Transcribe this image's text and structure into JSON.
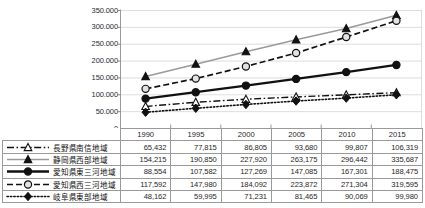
{
  "chart_data": {
    "type": "line",
    "title": "",
    "xlabel": "",
    "ylabel": "",
    "categories": [
      "1990",
      "1995",
      "2000",
      "2005",
      "2010",
      "2015"
    ],
    "ylim": [
      0,
      350000
    ],
    "ytick_values": [
      0,
      50000,
      100000,
      150000,
      200000,
      250000,
      300000,
      350000
    ],
    "ytick_labels": [
      "0",
      "50.000",
      "100.000",
      "150.000",
      "200.000",
      "250.000",
      "300.000",
      "350.000"
    ],
    "grid": true,
    "legend_position": "table-left",
    "series": [
      {
        "name": "長野県南信地域",
        "values": [
          65432,
          77815,
          86805,
          93680,
          99807,
          106319
        ],
        "value_labels": [
          "65,432",
          "77,815",
          "86,805",
          "93,680",
          "99,807",
          "106,319"
        ],
        "marker": "triangle-open",
        "line_style": "dashdot",
        "color": "#111111"
      },
      {
        "name": "静岡県西部地域",
        "values": [
          154215,
          190850,
          227920,
          263175,
          296442,
          335687
        ],
        "value_labels": [
          "154,215",
          "190,850",
          "227,920",
          "263,175",
          "296,442",
          "335,687"
        ],
        "marker": "triangle-filled",
        "line_style": "solid",
        "color": "#9a9a9a"
      },
      {
        "name": "愛知県東三河地域",
        "values": [
          88554,
          107582,
          127269,
          147085,
          167301,
          188475
        ],
        "value_labels": [
          "88,554",
          "107,582",
          "127,269",
          "147,085",
          "167,301",
          "188,475"
        ],
        "marker": "circle-filled",
        "line_style": "solid-thick",
        "color": "#111111"
      },
      {
        "name": "愛知県西三河地域",
        "values": [
          117592,
          147980,
          184092,
          223872,
          271304,
          319595
        ],
        "value_labels": [
          "117,592",
          "147,980",
          "184,092",
          "223,872",
          "271,304",
          "319,595"
        ],
        "marker": "circle-open",
        "line_style": "dashed",
        "color": "#111111"
      },
      {
        "name": "岐阜県東部地域",
        "values": [
          48162,
          59995,
          71231,
          81465,
          90069,
          99980
        ],
        "value_labels": [
          "48,162",
          "59,995",
          "71,231",
          "81,465",
          "90,069",
          "99,980"
        ],
        "marker": "diamond-filled",
        "line_style": "dotted",
        "color": "#111111"
      }
    ]
  }
}
